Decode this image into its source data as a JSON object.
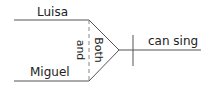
{
  "diagram": {
    "type": "sentence-diagram",
    "subjects": [
      {
        "label": "Luisa"
      },
      {
        "label": "Miguel"
      }
    ],
    "correlative_top": "Both",
    "conjunction": "and",
    "predicate": "can sing",
    "line_color": "#555555",
    "dash_color": "#888888"
  }
}
